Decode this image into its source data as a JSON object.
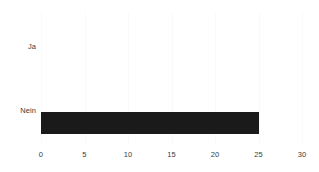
{
  "chart_data": {
    "type": "bar",
    "orientation": "horizontal",
    "title": "",
    "subtitle": "",
    "xlabel": "",
    "ylabel": "",
    "categories": [
      "Ja",
      "Nein"
    ],
    "values": [
      0,
      25
    ],
    "series": [
      {
        "name": "",
        "values": [
          0,
          25
        ]
      }
    ],
    "xlim": [
      0,
      30
    ],
    "xticks": [
      0,
      5,
      10,
      15,
      20,
      25,
      30
    ],
    "xtick_labels": [
      "0",
      "5",
      "10",
      "15",
      "20",
      "25",
      "30"
    ],
    "grid": true,
    "grid_axis": "x",
    "legend": false,
    "legend_position": "none",
    "annotations": [],
    "colors": {
      "bar": "#1a1a1a",
      "background": "#ffffff",
      "gridline": "#fafafa",
      "text": "#3b3b3b"
    }
  }
}
